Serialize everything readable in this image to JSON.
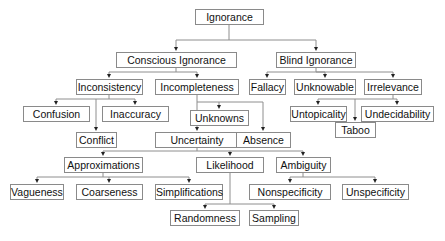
{
  "diagram": {
    "type": "taxonomy-tree",
    "root": "Ignorance",
    "nodes": {
      "ignorance": {
        "label": "Ignorance",
        "x": 195,
        "y": 9,
        "w": 69
      },
      "conscious_ignorance": {
        "label": "Conscious Ignorance",
        "x": 116,
        "y": 52,
        "w": 121
      },
      "blind_ignorance": {
        "label": "Blind Ignorance",
        "x": 276,
        "y": 52,
        "w": 80
      },
      "inconsistency": {
        "label": "Inconsistency",
        "x": 76,
        "y": 79,
        "w": 67
      },
      "incompleteness": {
        "label": "Incompleteness",
        "x": 155,
        "y": 79,
        "w": 84
      },
      "fallacy": {
        "label": "Fallacy",
        "x": 249,
        "y": 79,
        "w": 37
      },
      "unknowable": {
        "label": "Unknowable",
        "x": 294,
        "y": 79,
        "w": 62
      },
      "irrelevance": {
        "label": "Irrelevance",
        "x": 364,
        "y": 79,
        "w": 58
      },
      "confusion": {
        "label": "Confusion",
        "x": 23,
        "y": 106,
        "w": 67
      },
      "inaccuracy": {
        "label": "Inaccuracy",
        "x": 102,
        "y": 106,
        "w": 67
      },
      "unknowns": {
        "label": "Unknowns",
        "x": 190,
        "y": 110,
        "w": 59
      },
      "untopicality": {
        "label": "Untopicality",
        "x": 290,
        "y": 106,
        "w": 57
      },
      "undecidability": {
        "label": "Undecidability",
        "x": 361,
        "y": 106,
        "w": 73
      },
      "conflict": {
        "label": "Conflict",
        "x": 76,
        "y": 132,
        "w": 41
      },
      "uncertainty": {
        "label": "Uncertainty",
        "x": 155,
        "y": 132,
        "w": 84
      },
      "absence": {
        "label": "Absence",
        "x": 236,
        "y": 132,
        "w": 55
      },
      "taboo": {
        "label": "Taboo",
        "x": 335,
        "y": 122,
        "w": 41
      },
      "approximations": {
        "label": "Approximations",
        "x": 64,
        "y": 157,
        "w": 79
      },
      "likelihood": {
        "label": "Likelihood",
        "x": 196,
        "y": 157,
        "w": 68
      },
      "ambiguity": {
        "label": "Ambiguity",
        "x": 276,
        "y": 157,
        "w": 55
      },
      "vagueness": {
        "label": "Vagueness",
        "x": 10,
        "y": 184,
        "w": 54
      },
      "coarseness": {
        "label": "Coarseness",
        "x": 76,
        "y": 184,
        "w": 67
      },
      "simplifications": {
        "label": "Simplifications",
        "x": 155,
        "y": 184,
        "w": 68
      },
      "nonspecificity": {
        "label": "Nonspecificity",
        "x": 249,
        "y": 184,
        "w": 82
      },
      "unspecificity": {
        "label": "Unspecificity",
        "x": 342,
        "y": 184,
        "w": 67
      },
      "randomness": {
        "label": "Randomness",
        "x": 170,
        "y": 210,
        "w": 70
      },
      "sampling": {
        "label": "Sampling",
        "x": 249,
        "y": 210,
        "w": 50
      }
    },
    "edges": [
      [
        "ignorance",
        "conscious_ignorance"
      ],
      [
        "ignorance",
        "blind_ignorance"
      ],
      [
        "conscious_ignorance",
        "inconsistency"
      ],
      [
        "conscious_ignorance",
        "incompleteness"
      ],
      [
        "blind_ignorance",
        "fallacy"
      ],
      [
        "blind_ignorance",
        "unknowable"
      ],
      [
        "blind_ignorance",
        "irrelevance"
      ],
      [
        "inconsistency",
        "confusion"
      ],
      [
        "inconsistency",
        "inaccuracy"
      ],
      [
        "inconsistency",
        "conflict"
      ],
      [
        "incompleteness",
        "unknowns"
      ],
      [
        "incompleteness",
        "uncertainty"
      ],
      [
        "incompleteness",
        "absence"
      ],
      [
        "irrelevance",
        "untopicality"
      ],
      [
        "irrelevance",
        "undecidability"
      ],
      [
        "irrelevance",
        "taboo"
      ],
      [
        "uncertainty",
        "approximations"
      ],
      [
        "uncertainty",
        "likelihood"
      ],
      [
        "uncertainty",
        "ambiguity"
      ],
      [
        "approximations",
        "vagueness"
      ],
      [
        "approximations",
        "coarseness"
      ],
      [
        "approximations",
        "simplifications"
      ],
      [
        "likelihood",
        "randomness"
      ],
      [
        "likelihood",
        "sampling"
      ],
      [
        "ambiguity",
        "nonspecificity"
      ],
      [
        "ambiguity",
        "unspecificity"
      ]
    ]
  }
}
